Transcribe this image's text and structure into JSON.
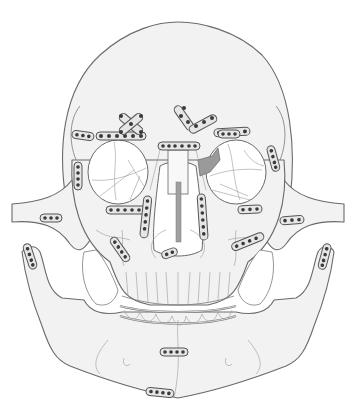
{
  "figure": {
    "colors": {
      "background": "#ffffff",
      "bone_fill": "#f2f2f2",
      "outline": "#6a6a6a",
      "plate_fill": "#e6e6e6",
      "screw": "#3a3a3a",
      "graft_shaded": "#9a9a9a"
    },
    "plates": [
      {
        "id": "supraorbital-left",
        "x": 96,
        "y": 136,
        "holes": 6,
        "angle": 0
      },
      {
        "id": "supraorbital-right",
        "x": 194,
        "y": 131,
        "holes": 4,
        "angle": -5
      },
      {
        "id": "frontal-x-left",
        "x": 130,
        "y": 122,
        "holes": 5,
        "shape": "x"
      },
      {
        "id": "frontal-y-center",
        "x": 186,
        "y": 112,
        "holes": 6,
        "shape": "y"
      },
      {
        "id": "lateral-frontal-left",
        "x": 82,
        "y": 133,
        "holes": 4,
        "angle": 10
      },
      {
        "id": "lateral-frontal-right",
        "x": 232,
        "y": 134,
        "holes": 4,
        "angle": 0
      },
      {
        "id": "lateral-orbital-left",
        "x": 78,
        "y": 172,
        "holes": 5,
        "angle": 90
      },
      {
        "id": "lateral-orbital-right",
        "x": 272,
        "y": 158,
        "holes": 4,
        "angle": 75
      },
      {
        "id": "nasal-bridge",
        "x": 178,
        "y": 147,
        "holes": 7,
        "angle": 0
      },
      {
        "id": "infraorbital-left",
        "x": 118,
        "y": 208,
        "holes": 6
      },
      {
        "id": "infraorbital-right",
        "x": 236,
        "y": 210,
        "holes": 4
      },
      {
        "id": "zygomatic-arch-left",
        "x": 50,
        "y": 218,
        "holes": 4
      },
      {
        "id": "zygomatic-arch-right",
        "x": 290,
        "y": 221,
        "holes": 4
      },
      {
        "id": "buttress-left",
        "x": 143,
        "y": 220,
        "holes": 6,
        "angle": 90
      },
      {
        "id": "buttress-right",
        "x": 203,
        "y": 220,
        "holes": 6,
        "angle": 90
      },
      {
        "id": "maxilla-left",
        "x": 119,
        "y": 248,
        "holes": 5
      },
      {
        "id": "maxilla-right",
        "x": 248,
        "y": 243,
        "holes": 5
      },
      {
        "id": "maxilla-center",
        "x": 170,
        "y": 258,
        "holes": 2
      },
      {
        "id": "condyle-left",
        "x": 30,
        "y": 262,
        "holes": 4
      },
      {
        "id": "condyle-right",
        "x": 326,
        "y": 262,
        "holes": 4
      },
      {
        "id": "symphysis-upper",
        "x": 173,
        "y": 352,
        "holes": 4
      },
      {
        "id": "symphysis-lower",
        "x": 156,
        "y": 392,
        "holes": 4
      }
    ],
    "arch_bars": 2
  }
}
